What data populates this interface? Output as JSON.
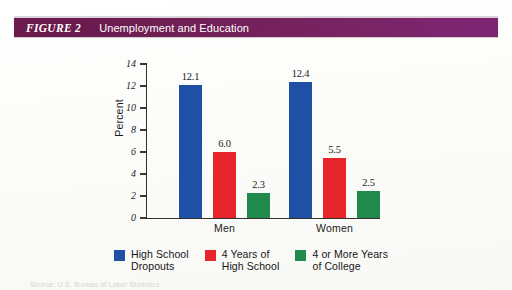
{
  "figure": {
    "number_label": "FIGURE 2",
    "title": "Unemployment and Education",
    "header_color_left": "#6d1a4c",
    "header_color_right": "#7e2572",
    "header_text_color": "#ffffff"
  },
  "source_note": "Source: U.S. Bureau of Labor Statistics",
  "chart_data": {
    "type": "bar",
    "title": "Unemployment and Education",
    "xlabel": "",
    "ylabel": "Percent",
    "ylim": [
      0,
      14
    ],
    "ytick_step": 2,
    "yticks": [
      "0",
      "2",
      "4",
      "6",
      "8",
      "10",
      "12",
      "14"
    ],
    "grid": false,
    "legend_position": "bottom",
    "categories": [
      "Men",
      "Women"
    ],
    "series": [
      {
        "name": "High School Dropouts",
        "legend_label": "High School\nDropouts",
        "color": "#2050a5",
        "values": [
          12.1,
          12.4
        ],
        "labels": [
          "12.1",
          "12.4"
        ]
      },
      {
        "name": "4 Years of High School",
        "legend_label": "4 Years of\nHigh School",
        "color": "#e8252a",
        "values": [
          6.0,
          5.5
        ],
        "labels": [
          "6.0",
          "5.5"
        ]
      },
      {
        "name": "4 or More Years of College",
        "legend_label": "4 or More Years\nof College",
        "color": "#1f8a4c",
        "values": [
          2.3,
          2.5
        ],
        "labels": [
          "2.3",
          "2.5"
        ]
      }
    ]
  }
}
